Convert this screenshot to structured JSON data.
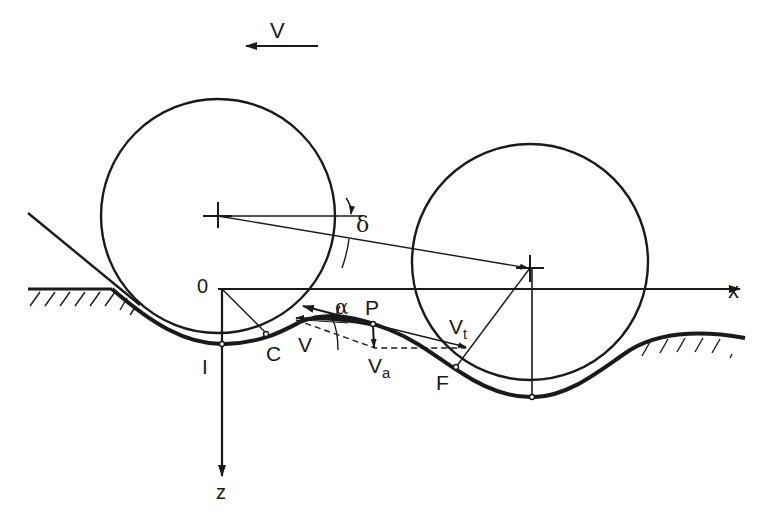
{
  "figure": {
    "colors": {
      "ink": "#1a1a1a",
      "background": "#ffffff"
    }
  },
  "labels": {
    "velocity_top": "V",
    "delta": "δ",
    "origin": "0",
    "x_axis": "x",
    "z_axis": "z",
    "alpha": "α",
    "point_P": "P",
    "point_C": "C",
    "point_I": "I",
    "point_F": "F",
    "vector_V": "V",
    "vector_Va_main": "V",
    "vector_Va_sub": "a",
    "vector_Vt_main": "V",
    "vector_Vt_sub": "t"
  },
  "elements": {
    "left_wheel": {
      "cx": 218,
      "cy": 216,
      "r": 118
    },
    "right_wheel": {
      "cx": 528,
      "cy": 268,
      "r": 118
    },
    "axes": {
      "origin": [
        218,
        289
      ],
      "x_end": [
        742,
        289
      ],
      "z_end": [
        218,
        478
      ]
    }
  }
}
